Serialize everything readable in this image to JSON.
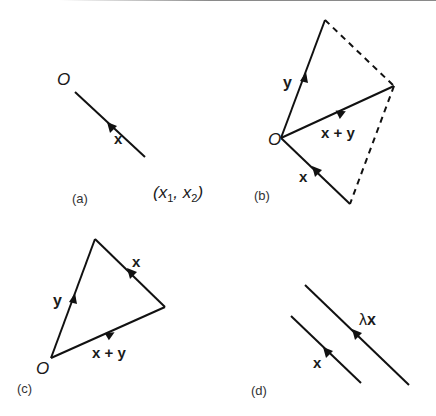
{
  "figure": {
    "panels": [
      {
        "id": "a",
        "label": "(a)",
        "origin_label": "O",
        "vectors": [
          {
            "name": "x",
            "label": "x",
            "from": [
              75,
              92
            ],
            "to": [
              145,
              157
            ],
            "style": "solid"
          }
        ],
        "endpoint_label": "(x1, x2)",
        "endpoint_parts": {
          "open": "(",
          "x1": "x",
          "sub1": "1",
          "comma": ", ",
          "x2": "x",
          "sub2": "2",
          "close": ")"
        }
      },
      {
        "id": "b",
        "label": "(b)",
        "origin_label": "O",
        "vectors": [
          {
            "name": "y",
            "label": "y",
            "from": [
              281,
              138
            ],
            "to": [
              325,
              20
            ],
            "style": "solid"
          },
          {
            "name": "x_plus_y",
            "label": "x + y",
            "from": [
              281,
              138
            ],
            "to": [
              394,
              86
            ],
            "style": "solid"
          },
          {
            "name": "x",
            "label": "x",
            "from": [
              281,
              138
            ],
            "to": [
              350,
              204
            ],
            "style": "solid"
          }
        ],
        "dashed_edges": [
          {
            "from": [
              325,
              20
            ],
            "to": [
              394,
              86
            ]
          },
          {
            "from": [
              394,
              86
            ],
            "to": [
              350,
              204
            ]
          }
        ]
      },
      {
        "id": "c",
        "label": "(c)",
        "origin_label": "O",
        "vectors": [
          {
            "name": "y",
            "label": "y",
            "from": [
              51,
              358
            ],
            "to": [
              95,
              239
            ],
            "style": "solid"
          },
          {
            "name": "x",
            "label": "x",
            "from": [
              95,
              239
            ],
            "to": [
              165,
              307
            ],
            "style": "solid"
          },
          {
            "name": "x_plus_y",
            "label": "x + y",
            "from": [
              51,
              358
            ],
            "to": [
              165,
              307
            ],
            "style": "solid"
          }
        ]
      },
      {
        "id": "d",
        "label": "(d)",
        "vectors": [
          {
            "name": "lambda_x",
            "label": "λx",
            "label_parts": {
              "lambda": "λ",
              "x": "x"
            },
            "from": [
              305,
              285
            ],
            "to": [
              409,
              385
            ],
            "style": "solid"
          },
          {
            "name": "x",
            "label": "x",
            "from": [
              291,
              316
            ],
            "to": [
              361,
              383
            ],
            "style": "solid"
          }
        ]
      }
    ],
    "colors": {
      "line": "#111111",
      "text": "#1a1a1a",
      "background": "#ffffff"
    }
  }
}
